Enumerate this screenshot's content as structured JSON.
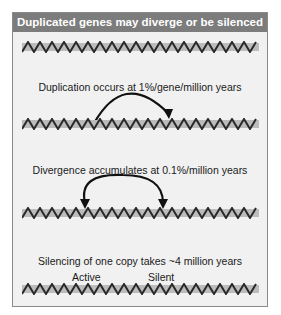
{
  "title": "Duplicated genes may diverge or be silenced",
  "panels": [
    {
      "caption": ""
    },
    {
      "caption": "Duplication occurs at 1%/gene/million years"
    },
    {
      "caption": "Divergence accumulates at 0.1%/million years"
    },
    {
      "caption": "Silencing of one copy takes ~4 million years",
      "labels": [
        "Active",
        "Silent"
      ]
    }
  ],
  "colors": {
    "header": "#7c7c7c",
    "background": "#f1f1f1",
    "helix_band": "#b8b8b8",
    "strand": "#2a2a2a"
  }
}
